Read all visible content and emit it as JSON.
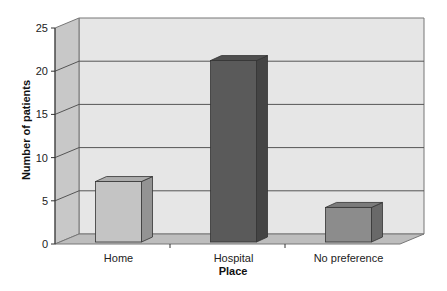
{
  "chart_data": {
    "type": "bar",
    "style": "3d-column",
    "title": "",
    "xlabel": "Place",
    "ylabel": "Number of patients",
    "categories": [
      "Home",
      "Hospital",
      "No preference"
    ],
    "values": [
      7,
      21,
      4
    ],
    "ylim": [
      0,
      25
    ],
    "yticks": [
      "0",
      "5",
      "10",
      "15",
      "20",
      "25"
    ],
    "grid": true,
    "legend": null,
    "bar_colors": [
      "#c4c4c4",
      "#5a5a5a",
      "#8c8c8c"
    ]
  }
}
